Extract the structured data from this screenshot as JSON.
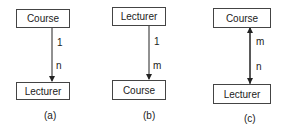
{
  "diagrams": [
    {
      "caption": "(a)",
      "top": "Course",
      "bottom": "Lecturer",
      "top_cardinality": "1",
      "bottom_cardinality": "n",
      "arrow": "down"
    },
    {
      "caption": "(b)",
      "top": "Lecturer",
      "bottom": "Course",
      "top_cardinality": "1",
      "bottom_cardinality": "m",
      "arrow": "down"
    },
    {
      "caption": "(c)",
      "top": "Course",
      "bottom": "Lecturer",
      "top_cardinality": "m",
      "bottom_cardinality": "n",
      "arrow": "both"
    }
  ]
}
